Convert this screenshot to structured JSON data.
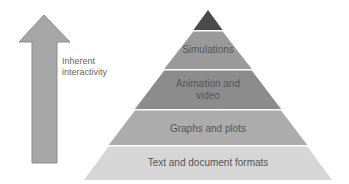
{
  "arrow": {
    "label_line1": "Inherent",
    "label_line2": "interactivity",
    "color": "#a6a6a6",
    "border": "#8c8c8c"
  },
  "pyramid": {
    "layers": [
      {
        "label": "",
        "color": "#4a4a4a"
      },
      {
        "label": "Simulations",
        "color": "#9a9a9a"
      },
      {
        "label_line1": "Animation and",
        "label_line2": "video",
        "color": "#8c8c8c"
      },
      {
        "label": "Graphs and plots",
        "color": "#acacac"
      },
      {
        "label": "Text and document formats",
        "color": "#d6d6d6"
      }
    ]
  }
}
